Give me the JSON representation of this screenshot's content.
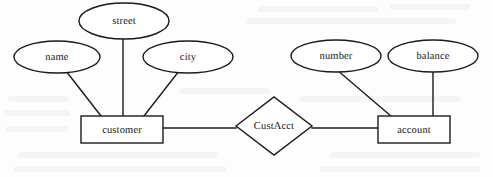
{
  "diagram": {
    "type": "entity-relationship-diagram",
    "title": "",
    "style": {
      "stroke_color": "#1a1a1a",
      "fill_color": "#ffffff",
      "background_color": "#fdfdfd",
      "line_width": 1.4,
      "text_color": "#141414"
    },
    "entities": [
      {
        "id": "customer",
        "label": "customer",
        "shape": "rectangle",
        "x": 81,
        "y": 116,
        "width": 82,
        "height": 27
      },
      {
        "id": "account",
        "label": "account",
        "shape": "rectangle",
        "x": 378,
        "y": 116,
        "width": 72,
        "height": 27
      }
    ],
    "relationships": [
      {
        "id": "custacct",
        "label": "CustAcct",
        "shape": "diamond",
        "cx": 274,
        "cy": 126,
        "rx": 38,
        "ry": 29
      }
    ],
    "attributes": [
      {
        "id": "name",
        "label": "name",
        "shape": "ellipse",
        "cx": 57,
        "cy": 57,
        "rx": 43,
        "ry": 16,
        "belongs_to": "customer"
      },
      {
        "id": "street",
        "label": "street",
        "shape": "ellipse",
        "cx": 124,
        "cy": 21,
        "rx": 45,
        "ry": 18,
        "belongs_to": "customer"
      },
      {
        "id": "city",
        "label": "city",
        "shape": "ellipse",
        "cx": 188,
        "cy": 57,
        "rx": 45,
        "ry": 16,
        "belongs_to": "customer"
      },
      {
        "id": "number",
        "label": "number",
        "shape": "ellipse",
        "cx": 336,
        "cy": 56,
        "rx": 45,
        "ry": 16,
        "belongs_to": "account"
      },
      {
        "id": "balance",
        "label": "balance",
        "shape": "ellipse",
        "cx": 433,
        "cy": 56,
        "rx": 45,
        "ry": 16,
        "belongs_to": "account"
      }
    ],
    "edges": [
      {
        "id": "edge-name-customer",
        "from": "name",
        "to": "customer",
        "x1": 66,
        "y1": 71,
        "x2": 101,
        "y2": 116
      },
      {
        "id": "edge-street-customer",
        "from": "street",
        "to": "customer",
        "x1": 123,
        "y1": 39,
        "x2": 123,
        "y2": 116
      },
      {
        "id": "edge-city-customer",
        "from": "city",
        "to": "customer",
        "x1": 179,
        "y1": 71,
        "x2": 144,
        "y2": 116
      },
      {
        "id": "edge-customer-custacct",
        "from": "customer",
        "to": "custacct",
        "x1": 163,
        "y1": 128,
        "x2": 236,
        "y2": 128
      },
      {
        "id": "edge-custacct-account",
        "from": "custacct",
        "to": "account",
        "x1": 312,
        "y1": 128,
        "x2": 378,
        "y2": 128
      },
      {
        "id": "edge-number-account",
        "from": "number",
        "to": "account",
        "x1": 337,
        "y1": 70,
        "x2": 391,
        "y2": 116
      },
      {
        "id": "edge-balance-account",
        "from": "balance",
        "to": "account",
        "x1": 433,
        "y1": 71,
        "x2": 433,
        "y2": 116
      }
    ],
    "ghost_marks": [
      {
        "x": 258,
        "y": 6,
        "w": 120,
        "h": 6
      },
      {
        "x": 390,
        "y": 4,
        "w": 80,
        "h": 6
      },
      {
        "x": 246,
        "y": 18,
        "w": 210,
        "h": 6
      },
      {
        "x": 8,
        "y": 96,
        "w": 60,
        "h": 6
      },
      {
        "x": 4,
        "y": 110,
        "w": 66,
        "h": 6
      },
      {
        "x": 6,
        "y": 126,
        "w": 62,
        "h": 6
      },
      {
        "x": 18,
        "y": 152,
        "w": 200,
        "h": 6
      },
      {
        "x": 14,
        "y": 166,
        "w": 212,
        "h": 6
      },
      {
        "x": 330,
        "y": 152,
        "w": 150,
        "h": 6
      },
      {
        "x": 320,
        "y": 166,
        "w": 160,
        "h": 6
      },
      {
        "x": 180,
        "y": 88,
        "w": 90,
        "h": 6
      },
      {
        "x": 300,
        "y": 96,
        "w": 160,
        "h": 6
      }
    ]
  }
}
